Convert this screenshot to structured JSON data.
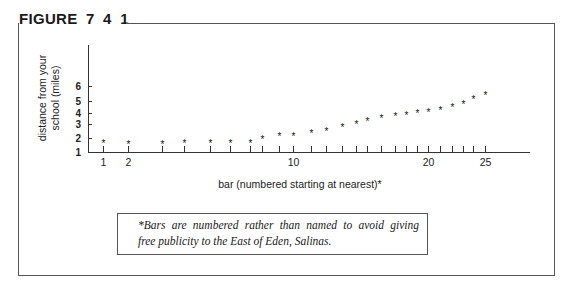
{
  "figure": {
    "title": "FIGURE  7 4 1",
    "caption_line1": "*Bars are numbered rather than named to avoid giving",
    "caption_line2": "free publicity to the East of Eden, Salinas."
  },
  "chart_data": {
    "type": "scatter",
    "title": "FIGURE 7 4 1",
    "xlabel": "bar (numbered starting at nearest)*",
    "ylabel": "distance from your school (miles)",
    "ylabel_lines": [
      "distance from your",
      "school (miles)"
    ],
    "x_tick_labels": [
      "1",
      "2",
      "10",
      "20",
      "25"
    ],
    "y_tick_labels": [
      "1",
      "2",
      "3",
      "4",
      "5",
      "6"
    ],
    "ylim": [
      1,
      6
    ],
    "xlim": [
      1,
      25
    ],
    "grid": false,
    "marker": "*",
    "x": [
      1,
      2,
      3,
      4,
      5,
      6,
      7,
      8,
      9,
      10,
      11,
      12,
      13,
      14,
      15,
      16,
      17,
      18,
      19,
      20,
      21,
      22,
      23,
      24,
      25
    ],
    "values": [
      1.7,
      1.65,
      1.65,
      1.7,
      1.75,
      1.75,
      1.75,
      2.0,
      2.2,
      2.25,
      2.4,
      2.6,
      2.85,
      3.1,
      3.4,
      3.6,
      3.8,
      3.95,
      4.05,
      4.2,
      4.35,
      4.55,
      4.85,
      5.2,
      5.45
    ]
  }
}
